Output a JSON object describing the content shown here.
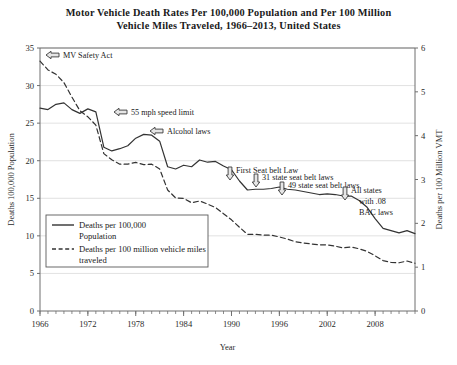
{
  "title": "Motor Vehicle Death Rates Per 100,000 Population and Per 100 Million Vehicle Miles Traveled, 1966–2013, United States",
  "title_line1": "Motor Vehicle Death Rates Per 100,000 Population and Per 100 Million",
  "title_line2": "Vehicle Miles Traveled, 1966–2013, United States",
  "footer_text": "",
  "legend": {
    "position": "inside-left-lower",
    "entries": [
      {
        "label_line1": "Deaths per 100,000",
        "label_line2": "Population",
        "style": "solid",
        "icon": "solid-line-swatch"
      },
      {
        "label_line1": "Deaths per 100 million vehicle miles",
        "label_line2": "traveled",
        "style": "dashed",
        "icon": "dashed-line-swatch"
      }
    ]
  },
  "annotations": [
    {
      "id": "mv-safety-act",
      "text": "MV Safety Act",
      "arrow": "left-arrow-icon",
      "x": 1966,
      "y": 33.8
    },
    {
      "id": "55-mph-speed-limit",
      "text": "55 mph speed limit",
      "arrow": "left-arrow-icon",
      "x": 1974,
      "y": 26.0
    },
    {
      "id": "alcohol-laws",
      "text": "Alcohol laws",
      "arrow": "left-arrow-icon",
      "x": 1982,
      "y": 23.5
    },
    {
      "id": "first-seat-belt-law",
      "text": "First Seat belt Law",
      "arrow": "down-arrow-icon",
      "x": 1987,
      "y": 20.0
    },
    {
      "id": "31-state-seat-belt-laws",
      "text": "31 state seat belt laws",
      "arrow": "down-arrow-icon",
      "x": 1990,
      "y": 19.5
    },
    {
      "id": "49-state-seat-belt-laws",
      "text": "49 state seat belt laws",
      "arrow": "down-arrow-icon",
      "x": 1996,
      "y": 17.0
    },
    {
      "id": "all-states-with-08-bac-laws",
      "text": "All states with .08 BAC laws",
      "line1": "All states",
      "line2": "with .08",
      "line3": "BAC laws",
      "arrow": "down-arrow-icon",
      "x": 2004,
      "y": 16.5
    }
  ],
  "chart_data": {
    "type": "line",
    "title": "Motor Vehicle Death Rates Per 100,000 Population and Per 100 Million Vehicle Miles Traveled, 1966–2013, United States",
    "xlabel": "Year",
    "ylabel": "Deaths 100,000 Population",
    "y2label": "Deaths per 100 Million VMT",
    "xlim": [
      1966,
      2013
    ],
    "ylim": [
      0,
      35
    ],
    "y2lim": [
      0,
      6
    ],
    "yticks": [
      0,
      5,
      10,
      15,
      20,
      25,
      30,
      35
    ],
    "y2ticks": [
      0,
      1,
      2,
      3,
      4,
      5,
      6
    ],
    "xticks": [
      1966,
      1972,
      1978,
      1984,
      1990,
      1996,
      2002,
      2008
    ],
    "xminor_step": 1,
    "grid": "horizontal",
    "x": [
      1966,
      1967,
      1968,
      1969,
      1970,
      1971,
      1972,
      1973,
      1974,
      1975,
      1976,
      1977,
      1978,
      1979,
      1980,
      1981,
      1982,
      1983,
      1984,
      1985,
      1986,
      1987,
      1988,
      1989,
      1990,
      1991,
      1992,
      1993,
      1994,
      1995,
      1996,
      1997,
      1998,
      1999,
      2000,
      2001,
      2002,
      2003,
      2004,
      2005,
      2006,
      2007,
      2008,
      2009,
      2010,
      2011,
      2012,
      2013
    ],
    "series": [
      {
        "name": "Deaths per 100,000 Population",
        "axis": "left",
        "style": "solid",
        "units": "deaths per 100,000 population",
        "values": [
          27.0,
          26.8,
          27.5,
          27.7,
          26.8,
          26.3,
          26.9,
          26.5,
          21.8,
          21.3,
          21.6,
          22.0,
          23.0,
          23.5,
          23.4,
          22.6,
          19.2,
          18.9,
          19.4,
          19.2,
          20.1,
          19.8,
          19.9,
          19.3,
          18.8,
          17.3,
          16.1,
          16.2,
          16.2,
          16.3,
          16.5,
          16.2,
          16.1,
          15.9,
          15.7,
          15.5,
          15.6,
          15.5,
          15.3,
          15.3,
          14.7,
          13.8,
          12.3,
          11.0,
          10.7,
          10.4,
          10.7,
          10.3
        ]
      },
      {
        "name": "Deaths per 100 million vehicle miles traveled",
        "axis": "right",
        "style": "dashed",
        "units": "deaths per 100 million VMT",
        "values": [
          5.7,
          5.5,
          5.4,
          5.21,
          4.88,
          4.57,
          4.43,
          4.24,
          3.59,
          3.45,
          3.35,
          3.35,
          3.39,
          3.34,
          3.35,
          3.24,
          2.76,
          2.58,
          2.57,
          2.47,
          2.51,
          2.44,
          2.36,
          2.22,
          2.08,
          1.91,
          1.75,
          1.75,
          1.73,
          1.73,
          1.69,
          1.64,
          1.58,
          1.55,
          1.53,
          1.51,
          1.51,
          1.48,
          1.44,
          1.46,
          1.42,
          1.36,
          1.26,
          1.15,
          1.11,
          1.1,
          1.14,
          1.09
        ]
      }
    ]
  }
}
